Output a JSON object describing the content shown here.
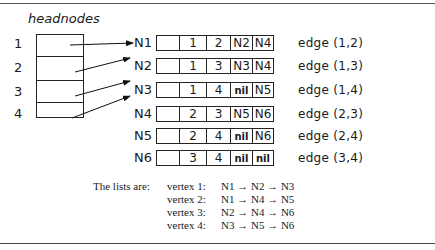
{
  "title": "headnodes",
  "headnodes": [
    "1",
    "2",
    "3",
    "4"
  ],
  "nodes": [
    {
      "name": "N1",
      "cells": [
        "",
        "1",
        "2",
        "N2",
        "N4"
      ],
      "edge": "edge (1,2)"
    },
    {
      "name": "N2",
      "cells": [
        "",
        "1",
        "3",
        "N3",
        "N4"
      ],
      "edge": "edge (1,3)"
    },
    {
      "name": "N3",
      "cells": [
        "",
        "1",
        "4",
        "nil",
        "N5"
      ],
      "edge": "edge (1,4)"
    },
    {
      "name": "N4",
      "cells": [
        "",
        "2",
        "3",
        "N5",
        "N6"
      ],
      "edge": "edge (2,3)"
    },
    {
      "name": "N5",
      "cells": [
        "",
        "2",
        "4",
        "nil",
        "N6"
      ],
      "edge": "edge (2,4)"
    },
    {
      "name": "N6",
      "cells": [
        "",
        "3",
        "4",
        "nil",
        "nil"
      ],
      "edge": "edge (3,4)"
    }
  ],
  "lists": {
    "intro": "The lists are:",
    "vertices": [
      {
        "label": "vertex 1:",
        "chain": "N1 → N2 → N3"
      },
      {
        "label": "vertex 2:",
        "chain": "N1 → N4 → N5"
      },
      {
        "label": "vertex 3:",
        "chain": "N2 → N4 → N6"
      },
      {
        "label": "vertex 4:",
        "chain": "N3 → N5 → N6"
      }
    ]
  }
}
